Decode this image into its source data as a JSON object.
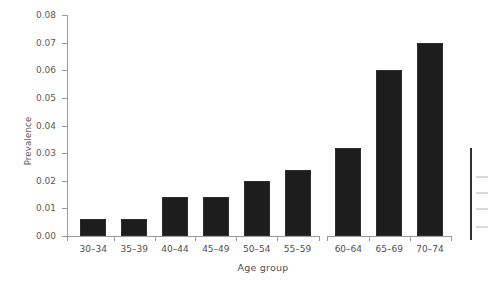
{
  "chart_data": {
    "type": "bar",
    "title": "",
    "subtitle": "",
    "xlabel": "Age group",
    "ylabel": "Prevalence",
    "categories": [
      "30–34",
      "35–39",
      "40–44",
      "45–49",
      "50–54",
      "55–59",
      "60–64",
      "65–69",
      "70–74"
    ],
    "values": [
      0.006,
      0.006,
      0.014,
      0.014,
      0.02,
      0.024,
      0.032,
      0.06,
      0.07
    ],
    "ylim": [
      0.0,
      0.08
    ],
    "yticks": [
      0.0,
      0.01,
      0.02,
      0.03,
      0.04,
      0.05,
      0.06,
      0.07,
      0.08
    ],
    "ytick_labels": [
      "0.00",
      "0.01",
      "0.02",
      "0.03",
      "0.04",
      "0.05",
      "0.06",
      "0.07",
      "0.08"
    ],
    "grid": false,
    "legend": null,
    "legend_position": "none",
    "bar_color": "#1d1d1d",
    "axis_color": "#9a9a9a",
    "axis_break_after_category": "55–59"
  },
  "axes": {
    "y_label": "Prevalence",
    "x_label": "Age group"
  }
}
